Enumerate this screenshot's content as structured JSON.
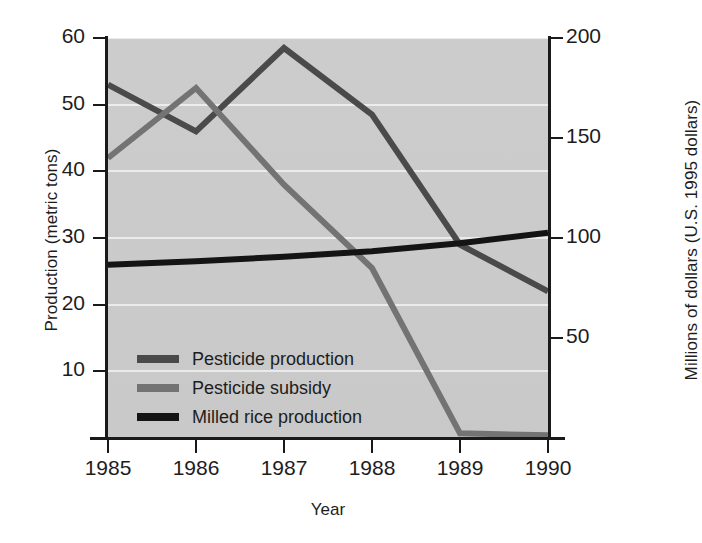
{
  "chart_data": {
    "type": "line",
    "title": "",
    "subtitle": "",
    "xlabel": "Year",
    "ylabel": "Production (metric tons)",
    "y2label": "Millions of dollars (U.S. 1995 dollars)",
    "x": [
      1985,
      1986,
      1987,
      1988,
      1989,
      1990
    ],
    "xticklabels": [
      "1985",
      "1986",
      "1987",
      "1988",
      "1989",
      "1990"
    ],
    "xlim": [
      1985,
      1990
    ],
    "ylim": [
      0,
      60
    ],
    "yticks": [
      10,
      20,
      30,
      40,
      50,
      60
    ],
    "yticklabels": [
      "10",
      "20",
      "30",
      "40",
      "50",
      "60"
    ],
    "y2lim": [
      0,
      200
    ],
    "y2ticks": [
      50,
      100,
      150,
      200
    ],
    "y2ticklabels": [
      "50",
      "100",
      "150",
      "200"
    ],
    "grid": true,
    "grid_axis": "y",
    "legend_position": "lower-left-inside",
    "plot_background": "#cfcfcf",
    "series": [
      {
        "name": "Pesticide production",
        "axis": "left",
        "unit": "metric tons",
        "color": "#4a4a4a",
        "values": [
          53.0,
          46.0,
          58.5,
          48.5,
          29.0,
          22.0
        ]
      },
      {
        "name": "Pesticide subsidy",
        "axis": "left",
        "unit": "metric tons",
        "color": "#737373",
        "values": [
          42.0,
          52.5,
          38.0,
          25.5,
          0.7,
          0.4
        ]
      },
      {
        "name": "Milled rice production",
        "axis": "left",
        "unit": "metric tons",
        "color": "#141414",
        "values": [
          26.0,
          26.5,
          27.2,
          28.0,
          29.2,
          30.8
        ]
      }
    ]
  },
  "legend": {
    "items": [
      {
        "label": "Pesticide production",
        "color": "#4a4a4a"
      },
      {
        "label": "Pesticide subsidy",
        "color": "#737373"
      },
      {
        "label": "Milled rice production",
        "color": "#141414"
      }
    ]
  },
  "axes": {
    "left_title": "Production (metric tons)",
    "right_title": "Millions of dollars (U.S. 1995 dollars)",
    "bottom_title": "Year",
    "left_ticks": [
      "60",
      "50",
      "40",
      "30",
      "20",
      "10"
    ],
    "right_ticks": [
      "200",
      "150",
      "100",
      "50"
    ],
    "bottom_ticks": [
      "1985",
      "1986",
      "1987",
      "1988",
      "1989",
      "1990"
    ]
  }
}
